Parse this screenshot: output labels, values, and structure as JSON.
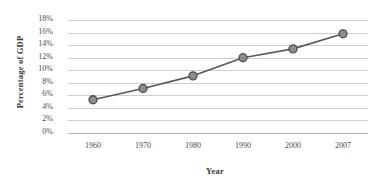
{
  "chart_data": {
    "type": "line",
    "title": "",
    "xlabel": "Year",
    "ylabel": "Percentage of GDP",
    "categories": [
      "1960",
      "1970",
      "1980",
      "1990",
      "2000",
      "2007"
    ],
    "x": [
      1960,
      1970,
      1980,
      1990,
      2000,
      2007
    ],
    "values": [
      5.3,
      7.1,
      9.1,
      12.0,
      13.4,
      15.8
    ],
    "series": [
      {
        "name": "Percentage of GDP",
        "values": [
          5.3,
          7.1,
          9.1,
          12.0,
          13.4,
          15.8
        ]
      }
    ],
    "ylim": [
      0,
      18
    ],
    "ytick_values": [
      0,
      2,
      4,
      6,
      8,
      10,
      12,
      14,
      16,
      18
    ],
    "ytick_labels": [
      "0%",
      "2%",
      "4%",
      "6%",
      "8%",
      "10%",
      "12%",
      "14%",
      "16%",
      "18%"
    ],
    "xtick_labels": [
      "1960",
      "1970",
      "1980",
      "1990",
      "2000",
      "2007"
    ],
    "grid": "horizontal",
    "legend": "none",
    "marker": "circle",
    "colors": {
      "line": "#595959",
      "marker_fill": "#8c8c8c",
      "marker_edge": "#4d4d4d",
      "gridline": "#cfcfcf",
      "axis": "#b4b4b4",
      "text": "#4a4a4a",
      "title_text": "#3b3b3b",
      "background": "#ffffff"
    }
  }
}
